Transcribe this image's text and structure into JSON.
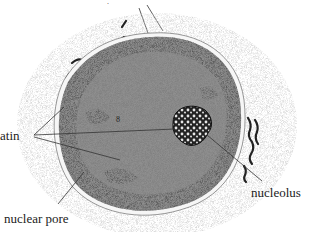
{
  "diagram": {
    "labels": {
      "chromatin": "atin",
      "nuclear_pore": "nuclear pore",
      "nucleolus": "nucleolus"
    },
    "colors": {
      "nucleoplasm": "#8e8e8e",
      "heterochromatin": "#5a5a5a",
      "perinuclear_halo": "#d8d8d8",
      "envelope": "#f4f4f4",
      "nucleolus": "#2a2a2a",
      "leader_line": "#333333"
    }
  }
}
